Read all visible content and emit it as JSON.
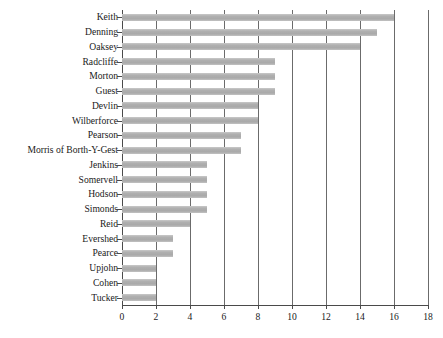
{
  "chart_data": {
    "type": "bar",
    "orientation": "horizontal",
    "title": "",
    "xlabel": "",
    "ylabel": "",
    "xlim": [
      0,
      18
    ],
    "xticks": [
      0,
      2,
      4,
      6,
      8,
      10,
      12,
      14,
      16,
      18
    ],
    "grid": "vertical",
    "legend": "none",
    "bar_color": "#b0b0b0",
    "categories": [
      "Keith",
      "Denning",
      "Oaksey",
      "Radcliffe",
      "Morton",
      "Guest",
      "Devlin",
      "Wilberforce",
      "Pearson",
      "Morris of Borth-Y-Gest",
      "Jenkins",
      "Somervell",
      "Hodson",
      "Simonds",
      "Reid",
      "Evershed",
      "Pearce",
      "Upjohn",
      "Cohen",
      "Tucker"
    ],
    "values": [
      16,
      15,
      14,
      9,
      9,
      9,
      8,
      8,
      7,
      7,
      5,
      5,
      5,
      5,
      4,
      3,
      3,
      2,
      2,
      2
    ]
  }
}
